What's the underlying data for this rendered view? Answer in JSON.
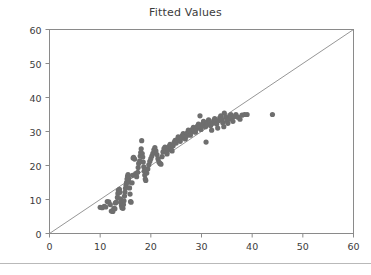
{
  "chart_data": {
    "type": "scatter",
    "title": "Fitted Values",
    "xlabel": "",
    "ylabel": "",
    "xlim": [
      0,
      60
    ],
    "ylim": [
      0,
      60
    ],
    "xticks": [
      0,
      10,
      20,
      30,
      40,
      50,
      60
    ],
    "yticks": [
      0,
      10,
      20,
      30,
      40,
      50,
      60
    ],
    "xtick_labels": [
      "0",
      "10",
      "20",
      "30",
      "40",
      "50",
      "60"
    ],
    "ytick_labels": [
      "0",
      "10",
      "20",
      "30",
      "40",
      "50",
      "60"
    ],
    "grid": false,
    "legend": null,
    "marker_color": "#6e6e6e",
    "marker_size": 5.2,
    "frame_color": "#8a8a8a",
    "reference_line": {
      "name": "identity-line",
      "x": [
        0,
        60
      ],
      "y": [
        0,
        60
      ],
      "color": "#8a8a8a",
      "width": 0.9
    },
    "series": [
      {
        "name": "observed-vs-fitted",
        "points": [
          [
            10.0,
            7.7
          ],
          [
            10.4,
            7.6
          ],
          [
            10.8,
            8.0
          ],
          [
            11.1,
            7.8
          ],
          [
            11.4,
            9.4
          ],
          [
            11.7,
            9.3
          ],
          [
            12.0,
            8.5
          ],
          [
            12.2,
            6.6
          ],
          [
            12.5,
            6.5
          ],
          [
            12.7,
            7.4
          ],
          [
            12.9,
            7.3
          ],
          [
            13.0,
            9.0
          ],
          [
            13.2,
            9.2
          ],
          [
            13.4,
            10.6
          ],
          [
            13.5,
            11.8
          ],
          [
            13.6,
            12.7
          ],
          [
            13.8,
            13.0
          ],
          [
            13.9,
            12.1
          ],
          [
            14.0,
            10.2
          ],
          [
            14.1,
            9.1
          ],
          [
            14.2,
            8.2
          ],
          [
            14.3,
            7.6
          ],
          [
            14.5,
            7.4
          ],
          [
            14.6,
            8.5
          ],
          [
            14.7,
            9.6
          ],
          [
            14.8,
            11.0
          ],
          [
            14.9,
            12.2
          ],
          [
            15.0,
            13.3
          ],
          [
            15.1,
            14.2
          ],
          [
            15.2,
            15.0
          ],
          [
            15.3,
            16.0
          ],
          [
            15.4,
            16.8
          ],
          [
            15.5,
            17.3
          ],
          [
            15.6,
            16.2
          ],
          [
            15.7,
            15.1
          ],
          [
            15.8,
            13.4
          ],
          [
            15.9,
            11.6
          ],
          [
            16.0,
            9.4
          ],
          [
            16.1,
            9.2
          ],
          [
            16.3,
            14.9
          ],
          [
            16.4,
            17.1
          ],
          [
            16.5,
            22.2
          ],
          [
            16.6,
            22.4
          ],
          [
            16.8,
            21.9
          ],
          [
            17.0,
            17.6
          ],
          [
            17.2,
            16.7
          ],
          [
            17.4,
            18.0
          ],
          [
            17.5,
            19.4
          ],
          [
            17.6,
            20.6
          ],
          [
            17.8,
            21.4
          ],
          [
            17.9,
            22.8
          ],
          [
            18.0,
            23.8
          ],
          [
            18.1,
            24.9
          ],
          [
            18.2,
            27.3
          ],
          [
            18.3,
            23.5
          ],
          [
            18.4,
            22.5
          ],
          [
            18.5,
            21.0
          ],
          [
            18.6,
            19.6
          ],
          [
            18.7,
            18.4
          ],
          [
            18.8,
            17.2
          ],
          [
            18.9,
            16.0
          ],
          [
            19.0,
            15.6
          ],
          [
            19.2,
            17.8
          ],
          [
            19.4,
            19.0
          ],
          [
            19.6,
            20.2
          ],
          [
            19.8,
            21.2
          ],
          [
            20.0,
            22.0
          ],
          [
            20.2,
            22.8
          ],
          [
            20.4,
            23.6
          ],
          [
            20.6,
            24.6
          ],
          [
            20.8,
            25.3
          ],
          [
            21.0,
            24.3
          ],
          [
            21.2,
            23.2
          ],
          [
            21.4,
            22.0
          ],
          [
            21.6,
            21.0
          ],
          [
            21.8,
            20.6
          ],
          [
            22.0,
            20.4
          ],
          [
            22.2,
            22.6
          ],
          [
            22.4,
            24.0
          ],
          [
            22.6,
            25.0
          ],
          [
            22.8,
            25.4
          ],
          [
            23.0,
            24.2
          ],
          [
            23.2,
            23.4
          ],
          [
            23.4,
            24.6
          ],
          [
            23.6,
            25.6
          ],
          [
            23.8,
            26.2
          ],
          [
            24.0,
            25.2
          ],
          [
            24.2,
            24.3
          ],
          [
            24.4,
            25.8
          ],
          [
            24.6,
            26.8
          ],
          [
            24.8,
            27.4
          ],
          [
            25.0,
            26.6
          ],
          [
            25.2,
            27.6
          ],
          [
            25.4,
            28.4
          ],
          [
            25.6,
            27.8
          ],
          [
            25.8,
            27.1
          ],
          [
            26.0,
            28.0
          ],
          [
            26.2,
            28.8
          ],
          [
            26.4,
            29.4
          ],
          [
            26.6,
            28.6
          ],
          [
            26.8,
            27.8
          ],
          [
            27.0,
            28.6
          ],
          [
            27.2,
            29.6
          ],
          [
            27.4,
            30.4
          ],
          [
            27.6,
            29.6
          ],
          [
            27.8,
            28.9
          ],
          [
            28.0,
            29.8
          ],
          [
            28.2,
            30.6
          ],
          [
            28.4,
            31.2
          ],
          [
            28.6,
            30.4
          ],
          [
            28.8,
            29.8
          ],
          [
            29.0,
            30.8
          ],
          [
            29.2,
            31.6
          ],
          [
            29.4,
            32.2
          ],
          [
            29.6,
            31.2
          ],
          [
            29.7,
            34.6
          ],
          [
            29.9,
            30.6
          ],
          [
            30.0,
            31.4
          ],
          [
            30.2,
            32.2
          ],
          [
            30.4,
            33.0
          ],
          [
            30.6,
            32.2
          ],
          [
            30.8,
            31.4
          ],
          [
            30.9,
            26.9
          ],
          [
            31.0,
            32.0
          ],
          [
            31.2,
            32.8
          ],
          [
            31.4,
            33.4
          ],
          [
            31.6,
            32.6
          ],
          [
            31.8,
            31.8
          ],
          [
            32.0,
            30.4
          ],
          [
            32.2,
            32.4
          ],
          [
            32.4,
            33.2
          ],
          [
            32.6,
            33.8
          ],
          [
            32.8,
            33.0
          ],
          [
            33.0,
            32.2
          ],
          [
            33.2,
            31.0
          ],
          [
            33.4,
            33.2
          ],
          [
            33.6,
            34.0
          ],
          [
            33.8,
            34.6
          ],
          [
            34.0,
            33.6
          ],
          [
            34.2,
            32.6
          ],
          [
            34.4,
            31.4
          ],
          [
            34.5,
            35.4
          ],
          [
            34.8,
            34.2
          ],
          [
            35.0,
            33.2
          ],
          [
            35.2,
            32.4
          ],
          [
            35.4,
            33.6
          ],
          [
            35.6,
            34.6
          ],
          [
            35.8,
            35.0
          ],
          [
            36.0,
            34.0
          ],
          [
            36.2,
            33.0
          ],
          [
            36.5,
            34.4
          ],
          [
            36.8,
            35.0
          ],
          [
            37.2,
            34.2
          ],
          [
            37.6,
            33.6
          ],
          [
            38.0,
            34.8
          ],
          [
            38.5,
            35.0
          ],
          [
            39.0,
            35.0
          ],
          [
            44.0,
            35.0
          ]
        ]
      }
    ]
  },
  "figure": {
    "background": "#ffffff"
  }
}
